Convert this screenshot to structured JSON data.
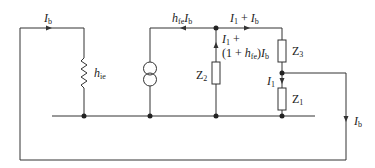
{
  "diagram": {
    "type": "circuit",
    "colors": {
      "line": "#333333",
      "background": "#ffffff"
    },
    "labels": {
      "ib_top": {
        "main": "I",
        "sub": "b"
      },
      "hie": {
        "main": "h",
        "sub": "ie"
      },
      "hfe_ib": {
        "main": "h",
        "sub": "fe",
        "tail": "I",
        "tail_sub": "b"
      },
      "i1_plus_ib": {
        "a": "I",
        "a_sub": "1",
        "mid": " + ",
        "b": "I",
        "b_sub": "b"
      },
      "z2_branch_line1": {
        "a": "I",
        "a_sub": "1",
        "tail": " +"
      },
      "z2_branch_line2": {
        "pre": "(1 + ",
        "h": "h",
        "h_sub": "fe",
        "post": ")",
        "i": "I",
        "i_sub": "b"
      },
      "z3": {
        "main": "Z",
        "sub": "3"
      },
      "z2": {
        "main": "Z",
        "sub": "2"
      },
      "z1": {
        "main": "Z",
        "sub": "1"
      },
      "i1": {
        "main": "I",
        "sub": "1"
      },
      "ib_right": {
        "main": "I",
        "sub": "b"
      }
    },
    "components": [
      {
        "id": "hie",
        "kind": "resistor-zigzag"
      },
      {
        "id": "hfe_source",
        "kind": "current-source"
      },
      {
        "id": "Z2",
        "kind": "impedance-box"
      },
      {
        "id": "Z3",
        "kind": "impedance-box"
      },
      {
        "id": "Z1",
        "kind": "impedance-box"
      }
    ]
  }
}
